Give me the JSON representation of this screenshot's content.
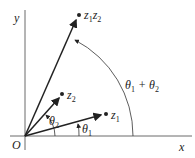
{
  "diagram": {
    "axes": {
      "x_label": "x",
      "y_label": "y",
      "origin_label": "O"
    },
    "vectors": [
      {
        "name": "z1",
        "label": "z",
        "sub": "1",
        "angle_label": "θ",
        "angle_sub": "1"
      },
      {
        "name": "z2",
        "label": "z",
        "sub": "2",
        "angle_label": "θ",
        "angle_sub": "2"
      },
      {
        "name": "z1z2",
        "label1": "z",
        "sub1": "1",
        "label2": "z",
        "sub2": "2",
        "angle_label": "θ1 + θ2"
      }
    ],
    "sum_angle": {
      "t": "θ",
      "s1": "1",
      "plus": " + ",
      "s2": "2"
    },
    "color": "#222222"
  }
}
